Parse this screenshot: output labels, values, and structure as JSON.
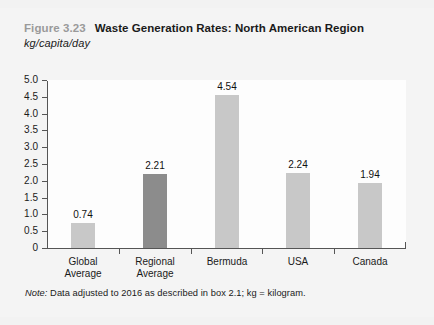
{
  "figure": {
    "number_label": "Figure 3.23",
    "title": "Waste Generation Rates: North American Region",
    "subtitle": "kg/capita/day",
    "note_lead": "Note:",
    "note_text": " Data adjusted to 2016 as described in box 2.1; kg = kilogram."
  },
  "colors": {
    "bar_default": "#c8c8c8",
    "bar_highlight": "#8c8c8c",
    "axis": "#555555",
    "figure_number": "#9a9a9a",
    "page_background": "#f4f4f4",
    "plot_background": "#fdfdfd"
  },
  "chart_data": {
    "type": "bar",
    "title": "Waste Generation Rates: North American Region",
    "subtitle": "kg/capita/day",
    "xlabel": "",
    "ylabel": "kg/capita/day",
    "ylim": [
      0,
      5.0
    ],
    "yticks": [
      "0",
      "0.5",
      "1.0",
      "1.5",
      "2.0",
      "2.5",
      "3.0",
      "3.5",
      "4.0",
      "4.5",
      "5.0"
    ],
    "ytick_values": [
      0,
      0.5,
      1.0,
      1.5,
      2.0,
      2.5,
      3.0,
      3.5,
      4.0,
      4.5,
      5.0
    ],
    "grid": false,
    "legend": null,
    "categories": [
      "Global Average",
      "Regional Average",
      "Bermuda",
      "USA",
      "Canada"
    ],
    "category_lines": [
      [
        "Global",
        "Average"
      ],
      [
        "Regional",
        "Average"
      ],
      [
        "Bermuda",
        ""
      ],
      [
        "USA",
        ""
      ],
      [
        "Canada",
        ""
      ]
    ],
    "values": [
      0.74,
      2.21,
      4.54,
      2.24,
      1.94
    ],
    "value_labels": [
      "0.74",
      "2.21",
      "4.54",
      "2.24",
      "1.94"
    ],
    "bar_colors": [
      "#c8c8c8",
      "#8c8c8c",
      "#c8c8c8",
      "#c8c8c8",
      "#c8c8c8"
    ],
    "note": "Note: Data adjusted to 2016 as described in box 2.1; kg = kilogram."
  }
}
